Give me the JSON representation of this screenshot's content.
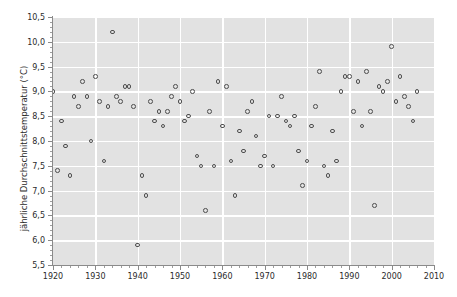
{
  "chart_data": {
    "type": "scatter",
    "title": "",
    "xlabel": "",
    "ylabel": "jährliche Durchschnittstemperatur (°C)",
    "xlim": [
      1920,
      2010
    ],
    "ylim": [
      5.5,
      10.5
    ],
    "grid": true,
    "legend": null,
    "decimal_separator": ",",
    "xticks": [
      1920,
      1930,
      1940,
      1950,
      1960,
      1970,
      1980,
      1990,
      2000,
      2010
    ],
    "xtick_labels": [
      "1920",
      "1930",
      "1940",
      "1950",
      "1960",
      "1970",
      "1980",
      "1990",
      "2000",
      "2010"
    ],
    "x_minor_tick_step": 2,
    "yticks": [
      5.5,
      6.0,
      6.5,
      7.0,
      7.5,
      8.0,
      8.5,
      9.0,
      9.5,
      10.0,
      10.5
    ],
    "ytick_labels": [
      "5,5",
      "6,0",
      "6,5",
      "7,0",
      "7,5",
      "8,0",
      "8,5",
      "9,0",
      "9,5",
      "10,0",
      "10,5"
    ],
    "y_minor_tick_step": 0.1,
    "marker": "open-circle",
    "marker_color": "#4e4e4e",
    "plot_background": "#e2e2e2",
    "grid_color": "#ffffff",
    "figure_background": "#ffffff",
    "series": [
      {
        "name": "jährliche Durchschnittstemperatur",
        "x": [
          1920,
          1921,
          1922,
          1923,
          1924,
          1925,
          1926,
          1927,
          1928,
          1929,
          1930,
          1931,
          1932,
          1933,
          1934,
          1935,
          1936,
          1937,
          1938,
          1939,
          1940,
          1941,
          1942,
          1943,
          1944,
          1945,
          1946,
          1947,
          1948,
          1949,
          1950,
          1951,
          1952,
          1953,
          1954,
          1955,
          1956,
          1957,
          1958,
          1959,
          1960,
          1961,
          1962,
          1963,
          1964,
          1965,
          1966,
          1967,
          1968,
          1969,
          1970,
          1971,
          1972,
          1973,
          1974,
          1975,
          1976,
          1977,
          1978,
          1979,
          1980,
          1981,
          1982,
          1983,
          1984,
          1985,
          1986,
          1987,
          1988,
          1989,
          1990,
          1991,
          1992,
          1993,
          1994,
          1995,
          1996,
          1997,
          1998,
          1999,
          2000,
          2001,
          2002,
          2003,
          2004,
          2005,
          2006
        ],
        "y": [
          9.0,
          7.4,
          8.4,
          7.9,
          7.3,
          8.9,
          8.7,
          9.2,
          8.9,
          8.0,
          9.3,
          8.8,
          7.6,
          8.7,
          10.2,
          8.9,
          8.8,
          9.1,
          9.1,
          8.7,
          5.9,
          7.3,
          6.9,
          8.8,
          8.4,
          8.6,
          8.3,
          8.6,
          8.9,
          9.1,
          8.8,
          8.4,
          8.5,
          9.0,
          7.7,
          7.5,
          6.6,
          8.6,
          7.5,
          9.2,
          8.3,
          9.1,
          7.6,
          6.9,
          8.2,
          7.8,
          8.6,
          8.8,
          8.1,
          7.5,
          7.7,
          8.5,
          7.5,
          8.5,
          8.9,
          8.4,
          8.3,
          8.5,
          7.8,
          7.1,
          7.6,
          8.3,
          8.7,
          9.4,
          7.5,
          7.3,
          8.2,
          7.6,
          9.0,
          9.3,
          9.3,
          8.6,
          9.2,
          8.3,
          9.4,
          8.6,
          6.7,
          9.1,
          9.0,
          9.2,
          9.9,
          8.8,
          9.3,
          8.9,
          8.7,
          8.4,
          9.0
        ]
      }
    ]
  },
  "axes": {
    "y_title": "jährliche Durchschnittstemperatur (°C)"
  }
}
